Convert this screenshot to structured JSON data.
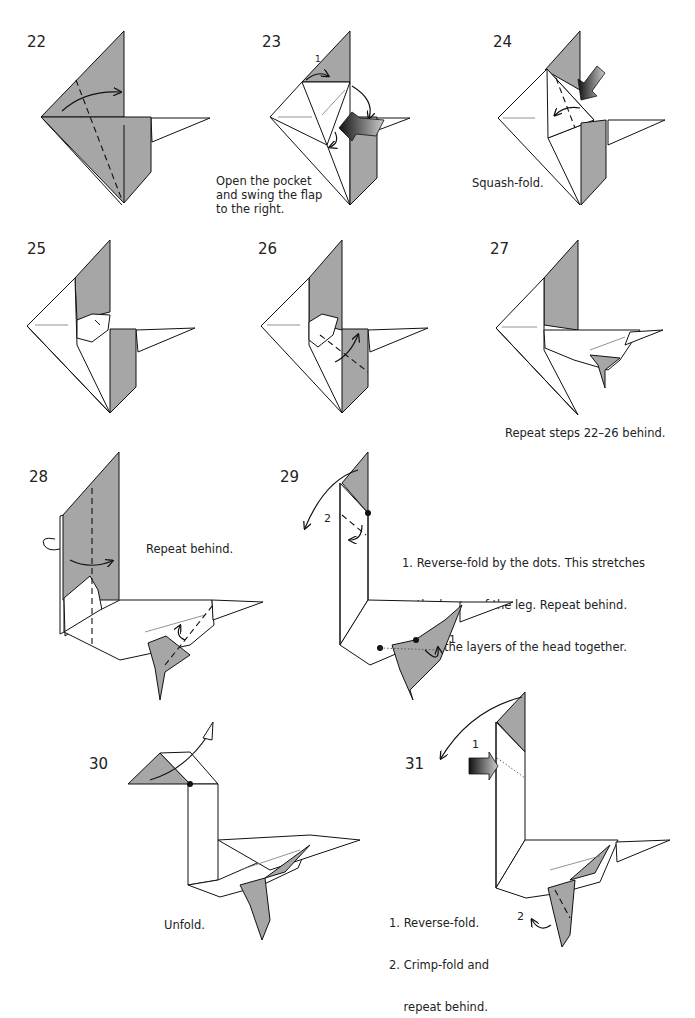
{
  "page": {
    "type": "origami-diagram-page",
    "colors": {
      "paper_colored_side": "#a6a6a6",
      "paper_white_side": "#ffffff",
      "lines": "#111111"
    }
  },
  "steps": [
    {
      "number": "22",
      "caption": []
    },
    {
      "number": "23",
      "caption": [
        "Open the pocket",
        "and swing the flap",
        "to the right."
      ],
      "markers": [
        "1"
      ]
    },
    {
      "number": "24",
      "caption": [
        "Squash-fold."
      ]
    },
    {
      "number": "25",
      "caption": []
    },
    {
      "number": "26",
      "caption": []
    },
    {
      "number": "27",
      "caption": [
        "Repeat steps 22–26 behind."
      ]
    },
    {
      "number": "28",
      "caption": [
        "Repeat behind."
      ]
    },
    {
      "number": "29",
      "caption": [
        "1. Reverse-fold by the dots. This stretches",
        "    the layers of the leg. Repeat behind.",
        "2. Fold the layers of the head together."
      ],
      "markers": [
        "1",
        "2"
      ]
    },
    {
      "number": "30",
      "caption": [
        "Unfold."
      ]
    },
    {
      "number": "31",
      "caption": [
        "1. Reverse-fold.",
        "2. Crimp-fold and",
        "    repeat behind."
      ],
      "markers": [
        "1",
        "2"
      ]
    }
  ]
}
